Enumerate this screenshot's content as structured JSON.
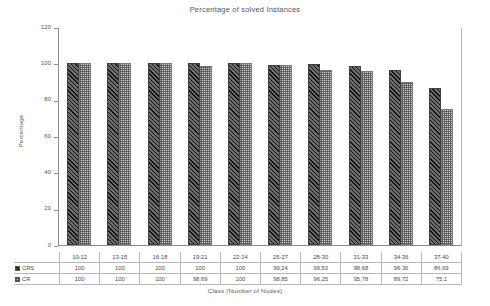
{
  "chart_data": {
    "type": "bar",
    "title": "Percentage of solved Instances",
    "xlabel": "Class (Number of Nodes)",
    "ylabel": "Percentage",
    "ylim": [
      0,
      120
    ],
    "yticks": [
      0,
      20,
      40,
      60,
      80,
      100,
      120
    ],
    "grid": false,
    "legend_position": "table-row-labels",
    "categories": [
      "10-12",
      "13-15",
      "16-18",
      "19-21",
      "22-24",
      "25-27",
      "28-30",
      "31-33",
      "34-36",
      "37-40"
    ],
    "series": [
      {
        "name": "CRS",
        "values": [
          100,
          100,
          100,
          100,
          100,
          99.24,
          99.53,
          98.68,
          96.36,
          86.69
        ],
        "labels": [
          "100",
          "100",
          "100",
          "100",
          "100",
          "99,24",
          "99,53",
          "98,68",
          "96,36",
          "86,69"
        ],
        "fill": "dark-diagonal-hatch",
        "color": "#6d6d6d"
      },
      {
        "name": "CR",
        "values": [
          100,
          100,
          100,
          98.69,
          100,
          98.85,
          96.25,
          95.78,
          89.72,
          75.1
        ],
        "labels": [
          "100",
          "100",
          "100",
          "98,69",
          "100",
          "98,85",
          "96,25",
          "95,78",
          "89,72",
          "75,1"
        ],
        "fill": "light-checker",
        "color": "#d5d5d5"
      }
    ]
  }
}
